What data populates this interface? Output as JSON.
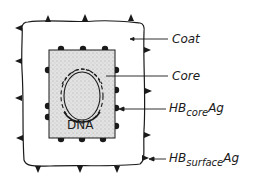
{
  "diagram": {
    "labels": {
      "coat": "Coat",
      "core": "Core",
      "hb_core_ag": {
        "prefix": "HB",
        "sub": "core",
        "suffix": "Ag"
      },
      "hb_surface_ag": {
        "prefix": "HB",
        "sub": "surface",
        "suffix": "Ag"
      },
      "dna": "DNA"
    },
    "colors": {
      "ink": "#1a1a1a",
      "core_fill": "#d9d9d9",
      "background": "#ffffff"
    }
  }
}
